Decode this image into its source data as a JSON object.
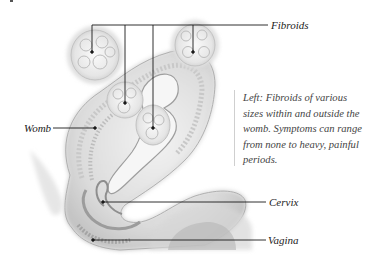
{
  "figure": {
    "labels": {
      "fibroids": "Fibroids",
      "womb": "Womb",
      "cervix": "Cervix",
      "vagina": "Vagina"
    },
    "caption": "Left: Fibroids of various sizes within and outside the womb. Symptoms can range from none to heavy, painful periods.",
    "colors": {
      "background": "#ffffff",
      "tissue_light": "#ececec",
      "tissue_mid": "#d2d2d2",
      "tissue_dark": "#a8a8a8",
      "leader_line": "#1a1a1a",
      "text": "#222222"
    }
  }
}
